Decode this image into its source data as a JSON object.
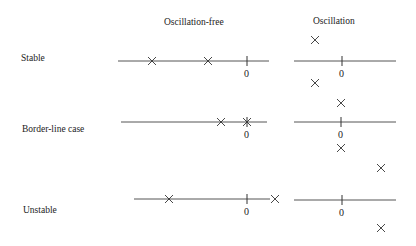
{
  "headers": {
    "oscillation_free": "Oscillation-free",
    "oscillation": "Oscillation"
  },
  "rows": [
    {
      "label": "Stable"
    },
    {
      "label": "Border-line case"
    },
    {
      "label": "Unstable"
    }
  ],
  "origin_label": "0",
  "diagram": {
    "stable": {
      "oscillation_free": {
        "poles_real": "two negative real poles"
      },
      "oscillation": {
        "poles": "complex conjugate pair with negative real part"
      }
    },
    "border_line": {
      "oscillation_free": {
        "poles_real": "one negative real pole, one pole at origin"
      },
      "oscillation": {
        "poles": "complex conjugate pair on imaginary axis"
      }
    },
    "unstable": {
      "oscillation_free": {
        "poles_real": "one negative real pole, one positive real pole"
      },
      "oscillation": {
        "poles": "complex conjugate pair with positive real part"
      }
    }
  }
}
